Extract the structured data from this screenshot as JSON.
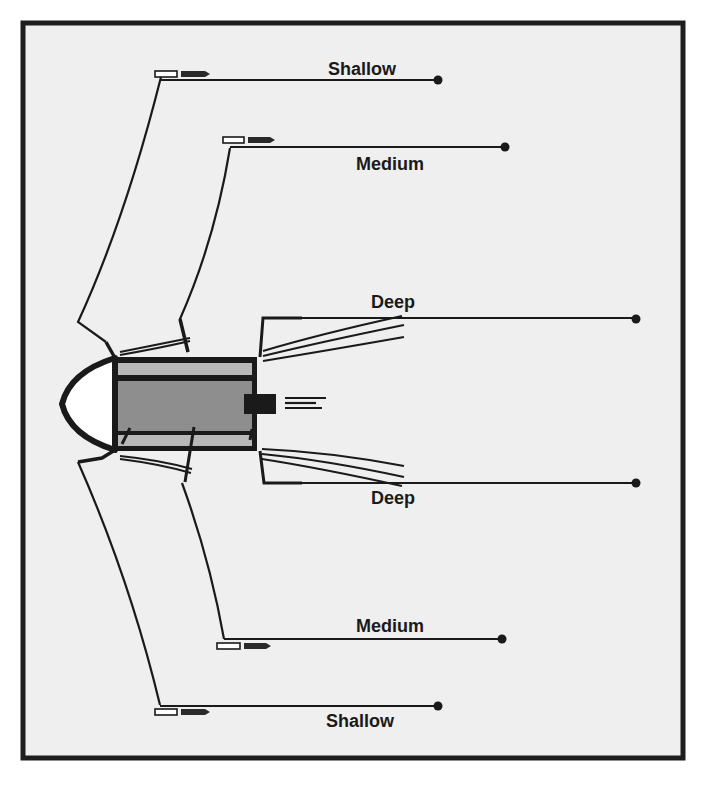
{
  "diagram": {
    "type": "depth-configuration-schematic",
    "frame": {
      "background": "#efefef",
      "border": "#1e1e1e"
    },
    "colors": {
      "line": "#1a1a1a",
      "outer_band": "#b8b8b8",
      "core": "#8e8e8e",
      "nose": "#ffffff"
    },
    "labels": {
      "top_shallow": "Shallow",
      "top_medium": "Medium",
      "top_deep": "Deep",
      "bottom_deep": "Deep",
      "bottom_medium": "Medium",
      "bottom_shallow": "Shallow"
    },
    "lines": [
      {
        "name": "Shallow",
        "position": "top"
      },
      {
        "name": "Medium",
        "position": "top"
      },
      {
        "name": "Deep",
        "position": "top"
      },
      {
        "name": "Deep",
        "position": "bottom"
      },
      {
        "name": "Medium",
        "position": "bottom"
      },
      {
        "name": "Shallow",
        "position": "bottom"
      }
    ]
  }
}
